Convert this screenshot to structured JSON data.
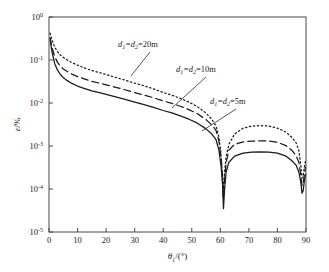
{
  "chart_data": {
    "type": "line",
    "title": "",
    "xlabel": "θ₁/(°)",
    "ylabel": "ε/%",
    "xlabel_base": "θ",
    "xlabel_sub": "1",
    "xlabel_tail": "/(°)",
    "ylabel_base": "ε",
    "ylabel_tail": "/%",
    "xlim": [
      0,
      90
    ],
    "ylim": [
      1e-05,
      1
    ],
    "yscale": "log",
    "xscale": "linear",
    "grid": false,
    "legend_position": "inline-annotations",
    "xticks": [
      0,
      10,
      20,
      30,
      40,
      50,
      60,
      70,
      80,
      90
    ],
    "xtick_labels": [
      "0",
      "10",
      "20",
      "30",
      "40",
      "50",
      "60",
      "70",
      "80",
      "90"
    ],
    "yticks": [
      1,
      0.1,
      0.01,
      0.001,
      0.0001,
      1e-05
    ],
    "ytick_labels": [
      "10⁰",
      "10⁻¹",
      "10⁻²",
      "10⁻³",
      "10⁻⁴",
      "10⁻⁵"
    ],
    "ytick_mantissa": "10",
    "ytick_exponents": [
      "0",
      "-1",
      "-2",
      "-3",
      "-4",
      "-5"
    ],
    "series": [
      {
        "name": "d1=d2=20m",
        "label_base": "d",
        "label_sub1": "1",
        "label_mid": "=d",
        "label_sub2": "2",
        "label_value": "=20m",
        "style": "dotted",
        "x": [
          0.4,
          1,
          2,
          3,
          4,
          5,
          6,
          8,
          10,
          12,
          15,
          18,
          20,
          23,
          26,
          30,
          33,
          36,
          40,
          43,
          46,
          49,
          52,
          55,
          57,
          58.5,
          59.5,
          60.2,
          60.7,
          61,
          61.3,
          62,
          63,
          65,
          68,
          71,
          74,
          77,
          80,
          83,
          85,
          86.5,
          87.5,
          88.2,
          88.6,
          89,
          89.4,
          89.8
        ],
        "y": [
          0.42,
          0.3,
          0.2,
          0.155,
          0.13,
          0.115,
          0.104,
          0.087,
          0.076,
          0.067,
          0.057,
          0.05,
          0.046,
          0.04,
          0.035,
          0.029,
          0.0255,
          0.022,
          0.0175,
          0.0152,
          0.0128,
          0.0105,
          0.0082,
          0.0058,
          0.0042,
          0.0029,
          0.0016,
          0.0007,
          0.00022,
          6.5e-05,
          0.00018,
          0.00055,
          0.0011,
          0.0019,
          0.0026,
          0.0029,
          0.00298,
          0.0029,
          0.0026,
          0.0021,
          0.0016,
          0.0012,
          0.0008,
          0.00035,
          0.00018,
          0.0002,
          0.00032,
          0.00045
        ]
      },
      {
        "name": "d1=d2=10m",
        "label_base": "d",
        "label_sub1": "1",
        "label_mid": "=d",
        "label_sub2": "2",
        "label_value": "=10m",
        "style": "dashed",
        "x": [
          0.4,
          1,
          2,
          3,
          4,
          5,
          6,
          8,
          10,
          12,
          15,
          18,
          20,
          23,
          26,
          30,
          33,
          36,
          40,
          43,
          46,
          49,
          52,
          55,
          57,
          58.5,
          59.5,
          60.3,
          60.8,
          61.1,
          61.5,
          62,
          63,
          65,
          68,
          71,
          74,
          77,
          80,
          83,
          85,
          86.5,
          87.5,
          88.2,
          88.6,
          89,
          89.4,
          89.8
        ],
        "y": [
          0.33,
          0.2,
          0.12,
          0.088,
          0.072,
          0.062,
          0.056,
          0.047,
          0.041,
          0.037,
          0.032,
          0.0285,
          0.0265,
          0.0235,
          0.0208,
          0.0175,
          0.0155,
          0.0136,
          0.0112,
          0.0098,
          0.0084,
          0.007,
          0.0056,
          0.0041,
          0.0031,
          0.0023,
          0.0013,
          0.0005,
          0.00018,
          6e-05,
          0.00016,
          0.0004,
          0.0008,
          0.0011,
          0.00125,
          0.0013,
          0.00132,
          0.0013,
          0.00122,
          0.00102,
          0.0008,
          0.0006,
          0.00042,
          0.0002,
          0.00012,
          0.00013,
          0.00022,
          0.00032
        ]
      },
      {
        "name": "d1=d2=5m",
        "label_base": "d",
        "label_sub1": "1",
        "label_mid": "=d",
        "label_sub2": "2",
        "label_value": "=5m",
        "style": "solid",
        "x": [
          0.4,
          1,
          2,
          3,
          4,
          5,
          6,
          8,
          10,
          12,
          15,
          18,
          20,
          23,
          26,
          30,
          33,
          36,
          40,
          43,
          46,
          49,
          52,
          55,
          57,
          58.5,
          59.5,
          60.3,
          60.8,
          61.1,
          61.5,
          62,
          63,
          65,
          68,
          71,
          74,
          77,
          80,
          83,
          85,
          86.5,
          87.5,
          88.2,
          88.6,
          89,
          89.4,
          89.8
        ],
        "y": [
          0.3,
          0.16,
          0.082,
          0.058,
          0.046,
          0.039,
          0.0345,
          0.0285,
          0.0248,
          0.0222,
          0.0192,
          0.0171,
          0.0159,
          0.0141,
          0.0125,
          0.0105,
          0.0093,
          0.0081,
          0.0067,
          0.0059,
          0.005,
          0.0042,
          0.0034,
          0.0025,
          0.0019,
          0.0014,
          0.0008,
          0.00032,
          0.00012,
          3.5e-05,
          0.0001,
          0.00024,
          0.00042,
          0.00058,
          0.00068,
          0.00072,
          0.00073,
          0.00072,
          0.00068,
          0.00058,
          0.00046,
          0.00036,
          0.00025,
          0.00014,
          8e-05,
          9e-05,
          0.00015,
          0.00022
        ]
      }
    ],
    "annotations": [
      {
        "text": "d1=d2=20m",
        "x": 38,
        "y": 0.045
      },
      {
        "text": "d1=d2=10m",
        "x": 51,
        "y": 0.012
      },
      {
        "text": "d1=d2=5m",
        "x": 57,
        "y": 0.0032
      }
    ]
  }
}
